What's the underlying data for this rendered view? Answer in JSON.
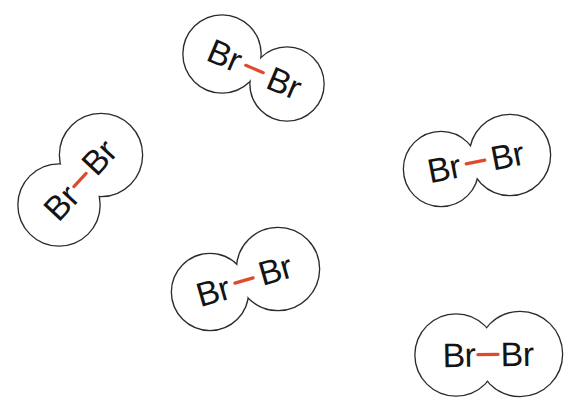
{
  "figure": {
    "background_color": "#ffffff",
    "outline_color": "#2b2b2b",
    "label_color": "#141414",
    "bond_color": "#e04a2c",
    "outline_width": 2.6,
    "molecule_count": 5,
    "molecules": [
      {
        "id": "br2-top-center",
        "atoms": [
          {
            "label": "Br",
            "cx": 222,
            "cy": 54,
            "r": 38.5
          },
          {
            "label": "Br",
            "cx": 287,
            "cy": 84,
            "r": 36.5
          }
        ],
        "angle_deg": 23,
        "bond": {
          "length": 19,
          "width": 3.2
        }
      },
      {
        "id": "br2-left",
        "atoms": [
          {
            "label": "Br",
            "cx": 59,
            "cy": 205,
            "r": 40.5
          },
          {
            "label": "Br",
            "cx": 101,
            "cy": 155,
            "r": 41
          }
        ],
        "angle_deg": -47,
        "bond": {
          "length": 18,
          "width": 3.2
        }
      },
      {
        "id": "br2-right-middle",
        "atoms": [
          {
            "label": "Br",
            "cx": 441,
            "cy": 169,
            "r": 37
          },
          {
            "label": "Br",
            "cx": 510,
            "cy": 155,
            "r": 40
          }
        ],
        "angle_deg": -11,
        "bond": {
          "length": 19,
          "width": 3.2
        }
      },
      {
        "id": "br2-bottom-center",
        "atoms": [
          {
            "label": "Br",
            "cx": 210,
            "cy": 292,
            "r": 38
          },
          {
            "label": "Br",
            "cx": 278,
            "cy": 269,
            "r": 41
          }
        ],
        "angle_deg": -16,
        "bond": {
          "length": 19,
          "width": 3.2
        }
      },
      {
        "id": "br2-bottom-right",
        "atoms": [
          {
            "label": "Br",
            "cx": 456,
            "cy": 355,
            "r": 40.5
          },
          {
            "label": "Br",
            "cx": 520,
            "cy": 354,
            "r": 42
          }
        ],
        "angle_deg": -1,
        "bond": {
          "length": 20,
          "width": 3.4
        }
      }
    ]
  }
}
